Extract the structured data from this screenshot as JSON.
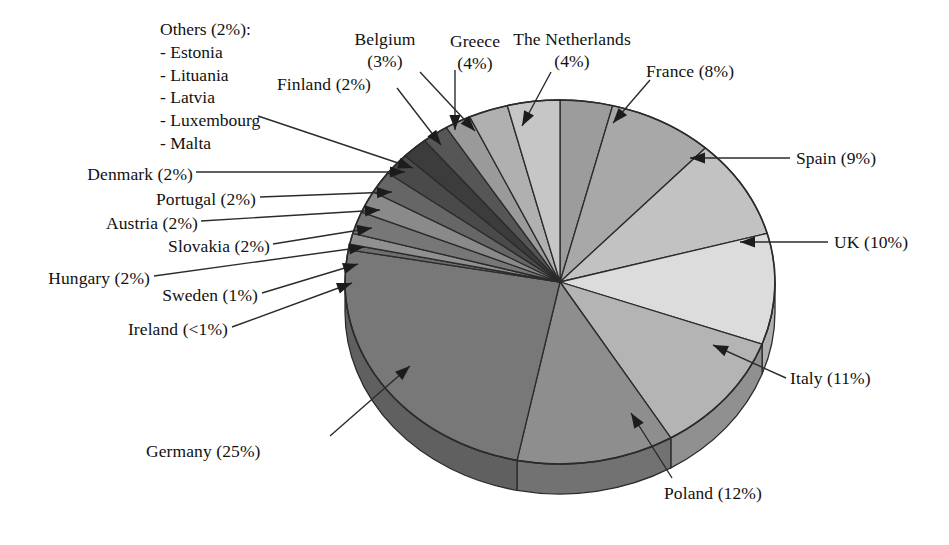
{
  "chart_data": {
    "type": "pie",
    "title": "",
    "three_d": true,
    "start_angle_deg": 0,
    "direction": "clockwise",
    "legend_position": "callout-labels",
    "grid": false,
    "categories": [
      "The Netherlands",
      "France",
      "Spain",
      "UK",
      "Italy",
      "Poland",
      "Germany",
      "Ireland",
      "Sweden",
      "Hungary",
      "Slovakia",
      "Austria",
      "Portugal",
      "Denmark",
      "Others",
      "Finland",
      "Belgium",
      "Greece"
    ],
    "values": [
      4,
      8,
      9,
      10,
      11,
      12,
      25,
      0.5,
      1,
      2,
      2,
      2,
      2,
      2,
      2,
      2,
      3,
      4
    ],
    "value_labels": [
      "4%",
      "8%",
      "9%",
      "10%",
      "11%",
      "12%",
      "25%",
      "<1%",
      "1%",
      "2%",
      "2%",
      "2%",
      "2%",
      "2%",
      "2%",
      "2%",
      "3%",
      "4%"
    ],
    "slices": [
      {
        "name": "The Netherlands",
        "label": "The Netherlands",
        "pct": "4%",
        "value": 4,
        "color": "#9c9c9c"
      },
      {
        "name": "France",
        "label": "France",
        "pct": "8%",
        "value": 8,
        "color": "#a8a8a8"
      },
      {
        "name": "Spain",
        "label": "Spain",
        "pct": "9%",
        "value": 9,
        "color": "#c2c2c2"
      },
      {
        "name": "UK",
        "label": "UK",
        "pct": "10%",
        "value": 10,
        "color": "#dcdcdc"
      },
      {
        "name": "Italy",
        "label": "Italy",
        "pct": "11%",
        "value": 11,
        "color": "#b4b4b4"
      },
      {
        "name": "Poland",
        "label": "Poland",
        "pct": "12%",
        "value": 12,
        "color": "#8e8e8e"
      },
      {
        "name": "Germany",
        "label": "Germany",
        "pct": "25%",
        "value": 25,
        "color": "#787878"
      },
      {
        "name": "Ireland",
        "label": "Ireland",
        "pct": "<1%",
        "value": 0.5,
        "color": "#6e6e6e"
      },
      {
        "name": "Sweden",
        "label": "Sweden",
        "pct": "1%",
        "value": 1,
        "color": "#909090"
      },
      {
        "name": "Hungary",
        "label": "Hungary",
        "pct": "2%",
        "value": 2,
        "color": "#777777"
      },
      {
        "name": "Slovakia",
        "label": "Slovakia",
        "pct": "2%",
        "value": 2,
        "color": "#8a8a8a"
      },
      {
        "name": "Austria",
        "label": "Austria",
        "pct": "2%",
        "value": 2,
        "color": "#666666"
      },
      {
        "name": "Portugal",
        "label": "Portugal",
        "pct": "2%",
        "value": 2,
        "color": "#4a4a4a"
      },
      {
        "name": "Denmark",
        "label": "Denmark",
        "pct": "2%",
        "value": 2,
        "color": "#3c3c3c"
      },
      {
        "name": "Others",
        "label": "Others",
        "pct": "2%",
        "value": 2,
        "color": "#565656"
      },
      {
        "name": "Finland",
        "label": "Finland",
        "pct": "2%",
        "value": 2,
        "color": "#9a9a9a"
      },
      {
        "name": "Belgium",
        "label": "Belgium",
        "pct": "3%",
        "value": 3,
        "color": "#b0b0b0"
      },
      {
        "name": "Greece",
        "label": "Greece",
        "pct": "4%",
        "value": 4,
        "color": "#c6c6c6"
      }
    ]
  },
  "labels": {
    "others_heading": "Others (2%):",
    "others_items": [
      "- Estonia",
      "- Lituania",
      "- Latvia",
      "- Luxembourg",
      "- Malta"
    ],
    "belgium_l1": "Belgium",
    "belgium_l2": "(3%)",
    "greece_l1": "Greece",
    "greece_l2": "(4%)",
    "netherlands_l1": "The Netherlands",
    "netherlands_l2": "(4%)",
    "finland": "Finland (2%)",
    "france": "France (8%)",
    "spain": "Spain (9%)",
    "uk": "UK (10%)",
    "italy": "Italy (11%)",
    "poland": "Poland (12%)",
    "germany": "Germany (25%)",
    "denmark": "Denmark (2%)",
    "portugal": "Portugal (2%)",
    "austria": "Austria (2%)",
    "slovakia": "Slovakia (2%)",
    "hungary": "Hungary (2%)",
    "sweden": "Sweden (1%)",
    "ireland": "Ireland (<1%)"
  },
  "colors": {
    "background": "#ffffff",
    "text": "#111111",
    "outline": "#2b2b2b",
    "leader": "#2b2b2b"
  }
}
